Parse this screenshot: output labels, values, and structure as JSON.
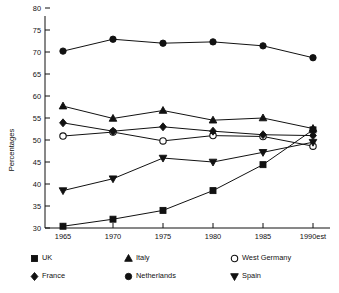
{
  "chart_data": {
    "type": "line",
    "title": "",
    "xlabel": "",
    "ylabel": "Percentages",
    "x": [
      "1965",
      "1970",
      "1975",
      "1980",
      "1985",
      "1990est"
    ],
    "xticklabels": [
      "1965",
      "1970",
      "1975",
      "1980",
      "1985",
      "1990est"
    ],
    "yticklabels": [
      "30",
      "35",
      "40",
      "45",
      "50",
      "55",
      "60",
      "65",
      "70",
      "75",
      "80"
    ],
    "ylim": [
      30,
      80
    ],
    "ytick_step": 5,
    "grid": false,
    "legend_position": "below-plot",
    "series": [
      {
        "name": "UK",
        "marker": "filled-square",
        "values": [
          30.4,
          32.0,
          34.0,
          38.5,
          44.4,
          52.3
        ]
      },
      {
        "name": "Italy",
        "marker": "filled-triangle-up",
        "values": [
          57.7,
          54.9,
          56.7,
          54.5,
          55.0,
          52.6
        ]
      },
      {
        "name": "West Germany",
        "marker": "open-circle",
        "values": [
          50.9,
          51.8,
          49.8,
          51.0,
          50.8,
          48.6
        ]
      },
      {
        "name": "France",
        "marker": "filled-diamond",
        "values": [
          53.9,
          52.0,
          53.0,
          52.0,
          51.2,
          51.0
        ]
      },
      {
        "name": "Netherlands",
        "marker": "filled-circle",
        "values": [
          70.2,
          72.9,
          72.0,
          72.3,
          71.4,
          68.7
        ]
      },
      {
        "name": "Spain",
        "marker": "filled-triangle-down",
        "values": [
          38.5,
          41.2,
          45.9,
          45.0,
          47.2,
          49.5
        ]
      }
    ]
  },
  "legend": {
    "entries": [
      {
        "label": "UK",
        "marker": "filled-square"
      },
      {
        "label": "Italy",
        "marker": "filled-triangle-up"
      },
      {
        "label": "West Germany",
        "marker": "open-circle"
      },
      {
        "label": "France",
        "marker": "filled-diamond"
      },
      {
        "label": "Netherlands",
        "marker": "filled-circle"
      },
      {
        "label": "Spain",
        "marker": "filled-triangle-down"
      }
    ]
  },
  "colors": {
    "ink": "#111111",
    "background": "#ffffff"
  }
}
